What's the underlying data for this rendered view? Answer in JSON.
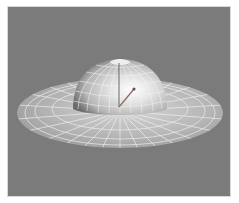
{
  "viewport": {
    "label": "3D viewport",
    "background_color": "#7b7b7b",
    "object": {
      "name": "dome-with-brim",
      "shading": "smooth shaded with wireframe overlay",
      "surface_color": "#c9c9c9",
      "wire_color": "#f2f2f2"
    },
    "gizmo": {
      "type": "manipulator",
      "handle_color": "#555555"
    }
  }
}
